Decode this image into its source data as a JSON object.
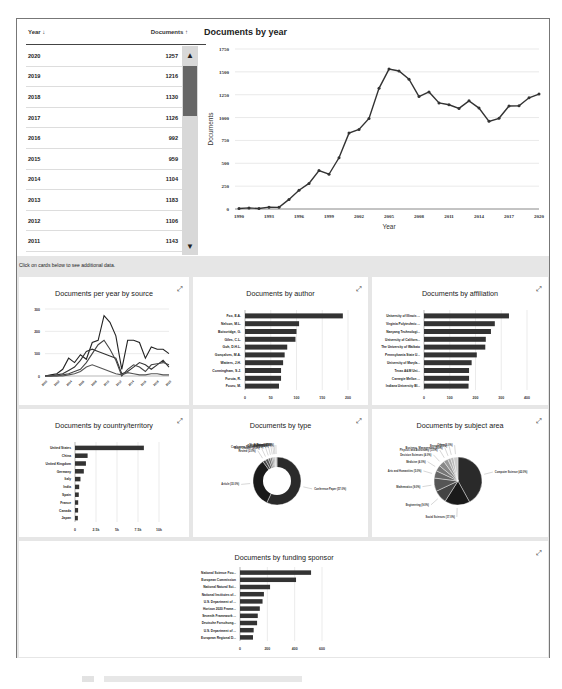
{
  "table": {
    "col_year": "Year ↓",
    "col_docs": "Documents ↑",
    "rows": [
      {
        "year": "2020",
        "docs": "1257"
      },
      {
        "year": "2019",
        "docs": "1216"
      },
      {
        "year": "2018",
        "docs": "1130"
      },
      {
        "year": "2017",
        "docs": "1126"
      },
      {
        "year": "2016",
        "docs": "992"
      },
      {
        "year": "2015",
        "docs": "959"
      },
      {
        "year": "2014",
        "docs": "1104"
      },
      {
        "year": "2013",
        "docs": "1183"
      },
      {
        "year": "2012",
        "docs": "1106"
      },
      {
        "year": "2011",
        "docs": "1143"
      }
    ],
    "scroll_up_icon": "▲",
    "scroll_down_icon": "▼"
  },
  "band_text": "Click on cards below to see additional data.",
  "expand_icon": "⤢",
  "cards": {
    "source": {
      "title": "Documents per year by source"
    },
    "author": {
      "title": "Documents by author"
    },
    "affiliation": {
      "title": "Documents by affiliation"
    },
    "country": {
      "title": "Documents by country/territory"
    },
    "type": {
      "title": "Documents by type"
    },
    "subject": {
      "title": "Documents by subject area"
    },
    "funding": {
      "title": "Documents by funding sponsor"
    }
  },
  "chart_data": [
    {
      "type": "line",
      "title": "Documents by year",
      "xlabel": "Year",
      "ylabel": "Documents",
      "ylim": [
        0,
        1750
      ],
      "yticks": [
        0,
        250,
        500,
        750,
        1000,
        1250,
        1500,
        1750
      ],
      "xticks": [
        1990,
        1993,
        1996,
        1999,
        2002,
        2005,
        2008,
        2011,
        2014,
        2017,
        2020
      ],
      "x": [
        1990,
        1991,
        1992,
        1993,
        1994,
        1995,
        1996,
        1997,
        1998,
        1999,
        2000,
        2001,
        2002,
        2003,
        2004,
        2005,
        2006,
        2007,
        2008,
        2009,
        2010,
        2011,
        2012,
        2013,
        2014,
        2015,
        2016,
        2017,
        2018,
        2019,
        2020
      ],
      "values": [
        5,
        12,
        5,
        20,
        18,
        105,
        205,
        280,
        420,
        380,
        560,
        830,
        870,
        990,
        1320,
        1530,
        1510,
        1420,
        1230,
        1280,
        1160,
        1140,
        1100,
        1183,
        1104,
        959,
        992,
        1126,
        1130,
        1216,
        1257
      ],
      "grid": true
    },
    {
      "type": "line",
      "title": "Documents per year by source",
      "ylim": [
        0,
        300
      ],
      "yticks": [
        0,
        100,
        200,
        300
      ],
      "series": [
        {
          "name": "Source 1",
          "values": [
            0,
            5,
            10,
            30,
            80,
            60,
            95,
            75,
            150,
            160,
            270,
            240,
            180,
            30,
            160,
            160,
            150,
            80,
            130,
            120,
            120,
            100
          ]
        },
        {
          "name": "Source 2",
          "values": [
            0,
            0,
            5,
            10,
            25,
            40,
            70,
            110,
            120,
            110,
            100,
            90,
            80,
            10,
            20,
            40,
            60,
            50,
            30,
            50,
            70,
            40
          ]
        },
        {
          "name": "Source 3",
          "values": [
            0,
            0,
            0,
            5,
            10,
            20,
            30,
            60,
            100,
            140,
            160,
            120,
            70,
            0,
            30,
            50,
            40,
            20,
            50,
            55,
            60,
            50
          ]
        },
        {
          "name": "Source 4",
          "values": [
            0,
            0,
            0,
            0,
            5,
            10,
            20,
            40,
            50,
            40,
            30,
            20,
            10,
            5,
            15,
            10,
            5,
            5,
            10,
            10,
            5,
            5
          ]
        }
      ]
    },
    {
      "type": "bar",
      "title": "Documents by author",
      "orientation": "horizontal",
      "categories": [
        "Fox, E.A.",
        "Nelson, M.L.",
        "Boisvridge, G.",
        "Giles, C.L.",
        "Goh, D.H.L.",
        "Gonçalves, M.A.",
        "Watters, J.H.",
        "Cunningham, S.J.",
        "Furuta, R.",
        "Fuuru, M."
      ],
      "values": [
        190,
        105,
        100,
        98,
        82,
        77,
        74,
        70,
        70,
        66
      ],
      "xticks": [
        0,
        50,
        100,
        150,
        200
      ],
      "xlim": [
        0,
        200
      ]
    },
    {
      "type": "bar",
      "title": "Documents by affiliation",
      "orientation": "horizontal",
      "categories": [
        "University of Illinois ...",
        "Virginia Polytechnic ...",
        "Nanyang Technologi...",
        "University of Californ...",
        "The University of Waikato",
        "Pennsylvania State U...",
        "University of Maryla...",
        "Texas A&M Uni...",
        "Carnegie Mellon ...",
        "Indiana University Bl..."
      ],
      "values": [
        330,
        275,
        260,
        240,
        238,
        205,
        185,
        175,
        175,
        173
      ],
      "xticks": [
        0,
        100,
        200,
        300,
        400
      ],
      "xlim": [
        0,
        400
      ]
    },
    {
      "type": "bar",
      "title": "Documents by country/territory",
      "orientation": "horizontal",
      "categories": [
        "United States",
        "China",
        "United Kingdom",
        "Germany",
        "Italy",
        "India",
        "Spain",
        "France",
        "Canada",
        "Japan"
      ],
      "values": [
        8200,
        1500,
        1300,
        1050,
        650,
        500,
        450,
        380,
        370,
        340
      ],
      "xticks": [
        "0",
        "2.5k",
        "5k",
        "7.5k",
        "10k"
      ],
      "xlim": [
        0,
        10000
      ]
    },
    {
      "type": "pie",
      "title": "Documents by type",
      "donut": true,
      "categories": [
        "Conference Paper",
        "Article",
        "Review",
        "Book Chapter",
        "Conference Review",
        "Editorial",
        "Book",
        "Note",
        "Erratum",
        "Short Survey"
      ],
      "values": [
        57,
        33,
        2,
        2,
        1.5,
        1.2,
        1,
        0.8,
        0.5,
        1
      ]
    },
    {
      "type": "pie",
      "title": "Documents by subject area",
      "categories": [
        "Computer Science",
        "Social Sciences",
        "Engineering",
        "Mathematics",
        "Arts and Humanities",
        "Medicine",
        "Decision Sciences",
        "Physics and Astronomy",
        "Business, Management",
        "Energy",
        "Other"
      ],
      "values": [
        42,
        17,
        9,
        9,
        5,
        4,
        4,
        3,
        2,
        2,
        3
      ]
    },
    {
      "type": "bar",
      "title": "Documents by funding sponsor",
      "orientation": "horizontal",
      "categories": [
        "National Science Fou...",
        "European Commission",
        "National Natural Sci...",
        "National Institutes of...",
        "U.S. Department of ...",
        "Horizon 2020 Frame...",
        "Seventh Framework ...",
        "Deutsche Forschung...",
        "U.S. Department of ...",
        "European Regional D..."
      ],
      "values": [
        520,
        410,
        220,
        175,
        165,
        145,
        130,
        125,
        100,
        95
      ],
      "xticks": [
        0,
        200,
        400,
        600
      ],
      "xlim": [
        0,
        600
      ]
    }
  ]
}
